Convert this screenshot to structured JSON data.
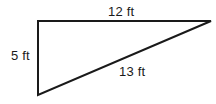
{
  "figure": {
    "type": "right-triangle-diagram",
    "background_color": "#ffffff",
    "stroke_color": "#1a1a1a",
    "stroke_width": 2,
    "vertices": {
      "top_left": [
        38,
        21
      ],
      "bottom_left": [
        38,
        95
      ],
      "right": [
        211,
        21
      ]
    },
    "sides": {
      "top": {
        "name": "top-side",
        "label": "12 ft",
        "value": 12,
        "unit": "ft",
        "from": "top_left",
        "to": "right"
      },
      "left": {
        "name": "left-side",
        "label": "5 ft",
        "value": 5,
        "unit": "ft",
        "from": "top_left",
        "to": "bottom_left"
      },
      "hypotenuse": {
        "name": "hypotenuse-side",
        "label": "13 ft",
        "value": 13,
        "unit": "ft",
        "from": "bottom_left",
        "to": "right"
      }
    },
    "labels": {
      "top": "12 ft",
      "left": "5 ft",
      "hypotenuse": "13 ft"
    }
  }
}
